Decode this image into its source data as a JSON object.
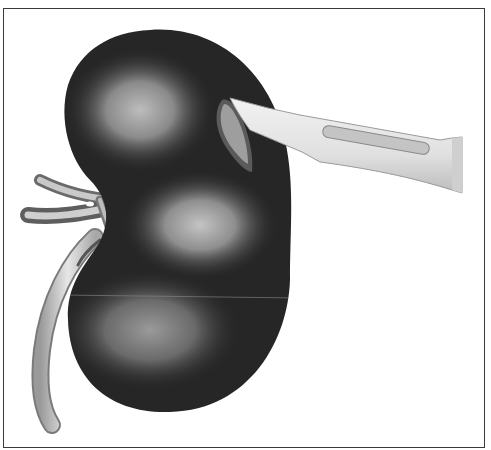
{
  "figure": {
    "subject": "Kidney with scalpel incision",
    "elements": [
      "kidney",
      "scalpel",
      "renal-vessels",
      "ureter"
    ],
    "style": "grayscale medical illustration",
    "frame": {
      "border_color": "#3a3a3a",
      "background": "#ffffff"
    },
    "colors": {
      "kidney_dark": "#262626",
      "kidney_highlight": "#b8b8b8",
      "scalpel_light": "#e8e8e8",
      "scalpel_slot": "#bdbdbd",
      "ureter": "#c8c8c8"
    }
  }
}
